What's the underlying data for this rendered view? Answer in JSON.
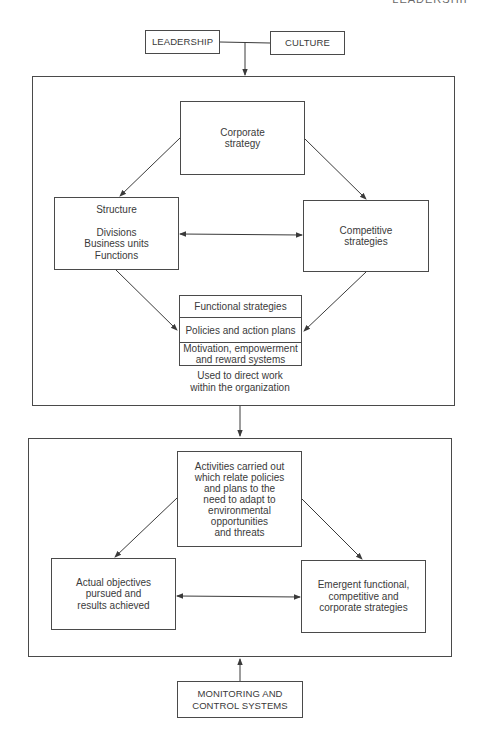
{
  "page_header": "LEADERSHIP",
  "top_inputs": {
    "leadership": "LEADERSHIP",
    "culture": "CULTURE"
  },
  "formulation_panel": {
    "corporate_strategy": [
      "Corporate",
      "strategy"
    ],
    "structure": {
      "title": "Structure",
      "items": [
        "Divisions",
        "Business units",
        "Functions"
      ]
    },
    "competitive_strategies": [
      "Competitive",
      "strategies"
    ],
    "functional_stack": [
      [
        "Functional strategies"
      ],
      [
        "Policies and action plans"
      ],
      [
        "Motivation, empowerment",
        "and reward systems"
      ]
    ],
    "caption": [
      "Used to direct work",
      "within the organization"
    ]
  },
  "implementation_panel": {
    "activities": [
      "Activities carried out",
      "which relate policies",
      "and plans to the",
      "need to adapt to",
      "environmental",
      "opportunities",
      "and threats"
    ],
    "actual_objectives": [
      "Actual objectives",
      "pursued and",
      "results achieved"
    ],
    "emergent_strategies": [
      "Emergent functional,",
      "competitive and",
      "corporate strategies"
    ]
  },
  "bottom_input": {
    "monitoring": [
      "MONITORING AND",
      "CONTROL SYSTEMS"
    ]
  },
  "colors": {
    "line": "#4a4a4a",
    "text": "#3a3a3a",
    "background": "#ffffff"
  }
}
